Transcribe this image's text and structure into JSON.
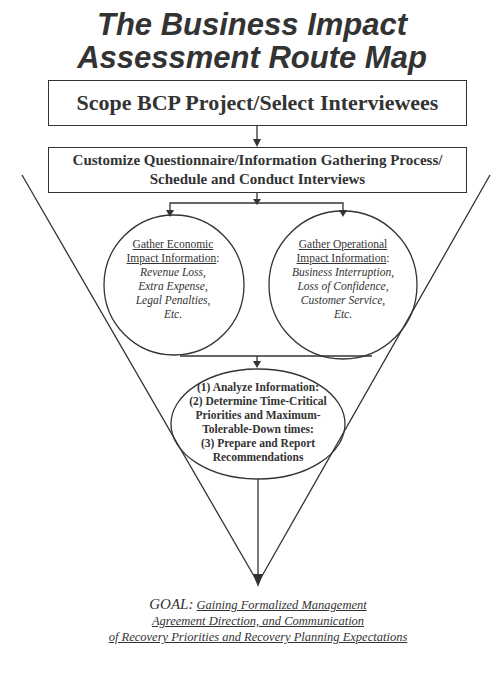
{
  "title": {
    "line1": "The Business Impact",
    "line2": "Assessment Route Map"
  },
  "steps": {
    "scope": "Scope BCP Project/Select Interviewees",
    "customize": {
      "line1": "Customize Questionnaire/Information Gathering Process/",
      "line2": "Schedule and Conduct Interviews"
    }
  },
  "economic": {
    "heading_line1": "Gather Economic",
    "heading_line2": "Impact Information",
    "colon": ":",
    "items": [
      "Revenue Loss,",
      "Extra Expense,",
      "Legal Penalties,",
      "Etc."
    ]
  },
  "operational": {
    "heading_line1": "Gather Operational",
    "heading_line2": "Impact Information",
    "colon": ":",
    "items": [
      "Business Interruption,",
      "Loss of Confidence,",
      "Customer Service,",
      "Etc."
    ]
  },
  "analysis": {
    "lines": [
      "(1) Analyze Information:",
      "(2) Determine Time-Critical",
      "Priorities and Maximum-",
      "Tolerable-Down times:",
      "(3) Prepare and Report",
      "Recommendations"
    ]
  },
  "goal": {
    "label": "GOAL:",
    "line1": "Gaining Formalized Management",
    "line2": "Agreement Direction, and Communication",
    "line3": "of Recovery Priorities and Recovery Planning Expectations"
  },
  "colors": {
    "ink": "#333333",
    "background": "#ffffff"
  }
}
